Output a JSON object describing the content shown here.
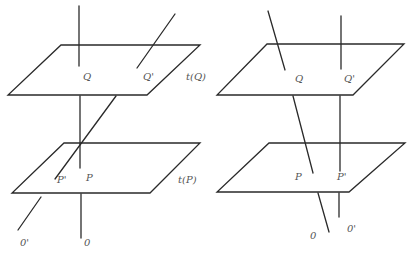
{
  "left_figure": {
    "labels": {
      "Q": "Q",
      "Q_prime": "Q'",
      "tQ": "t(Q)",
      "P": "P",
      "P_prime": "P'",
      "tP": "t(P)",
      "O": "0",
      "O_prime": "0'"
    }
  },
  "right_figure": {
    "labels": {
      "Q": "Q",
      "Q_prime": "Q'",
      "P": "P",
      "P_prime": "P'",
      "O": "0",
      "O_prime": "0'"
    }
  },
  "colors": {
    "line": "#2a2a2a",
    "label": "#555555"
  }
}
